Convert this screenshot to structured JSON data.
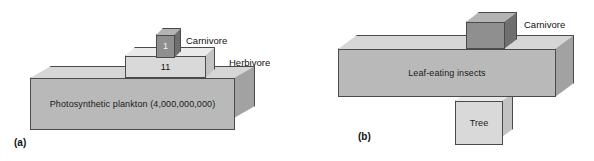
{
  "figure": {
    "type": "ecological-biomass-pyramid-diagram",
    "panels": [
      {
        "tag": "(a)",
        "orientation": "upright-pyramid",
        "levels": [
          {
            "name": "carnivore",
            "callout": "Carnivore",
            "value_label": "1",
            "tone": "dark",
            "trophic_level": 3
          },
          {
            "name": "herbivore",
            "callout": "Herbivore",
            "value_label": "11",
            "tone": "light",
            "trophic_level": 2
          },
          {
            "name": "producer",
            "callout": "",
            "value_label": "Photosynthetic plankton (4,000,000,000)",
            "tone": "mid",
            "trophic_level": 1
          }
        ]
      },
      {
        "tag": "(b)",
        "orientation": "inverted-pyramid",
        "levels": [
          {
            "name": "carnivore",
            "callout": "Carnivore",
            "value_label": "",
            "tone": "dark",
            "trophic_level": 3
          },
          {
            "name": "herbivore",
            "callout": "",
            "value_label": "Leaf-eating insects",
            "tone": "mid",
            "trophic_level": 2
          },
          {
            "name": "producer",
            "callout": "",
            "value_label": "Tree",
            "tone": "light",
            "trophic_level": 1
          }
        ]
      }
    ]
  },
  "colors": {
    "outline": "#4a4a4a",
    "fill_mid_front": "#b9b9b9",
    "fill_mid_top": "#d6d6d6",
    "fill_light_front": "#d9d9d9",
    "fill_dark_front": "#8f8f8f",
    "text": "#111111",
    "background": "#ffffff"
  }
}
